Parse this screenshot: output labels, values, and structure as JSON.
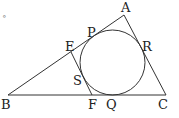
{
  "diagram": {
    "type": "geometry",
    "points": {
      "A": {
        "label": "A",
        "x": 124,
        "y": 15
      },
      "B": {
        "label": "B",
        "x": 8,
        "y": 95
      },
      "C": {
        "label": "C",
        "x": 166,
        "y": 95
      },
      "E": {
        "label": "E",
        "x": 71,
        "y": 52
      },
      "F": {
        "label": "F",
        "x": 92,
        "y": 95
      },
      "P": {
        "label": "P"
      },
      "R": {
        "label": "R"
      },
      "S": {
        "label": "S"
      },
      "Q": {
        "label": "Q"
      }
    },
    "circle": {
      "cx": 112.5,
      "cy": 62.5,
      "r": 32.5
    },
    "marker": "∘"
  }
}
